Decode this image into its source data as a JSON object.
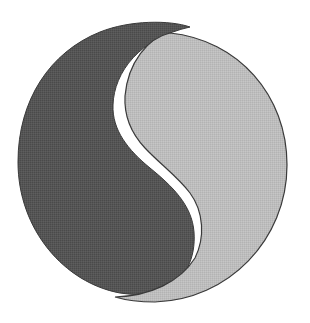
{
  "figure": {
    "kind": "yin-yang emblem",
    "colors": {
      "dark_half": "#555555",
      "light_half": "#bdbdbd",
      "outline": "#3a3a3a",
      "gap": "#ffffff",
      "background": "#ffffff"
    }
  }
}
